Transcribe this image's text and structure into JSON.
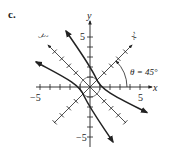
{
  "panel_label": "c.",
  "axes": {
    "x_label": "x",
    "y_label": "y",
    "x_prime_label": "x′",
    "y_prime_label": "y′",
    "x_min_label": "−5",
    "x_max_label": "5",
    "y_max_label": "5",
    "y_min_label": "−5"
  },
  "angle_label": "θ = 45°",
  "colors": {
    "ink": "#222222",
    "background": "#ffffff"
  }
}
